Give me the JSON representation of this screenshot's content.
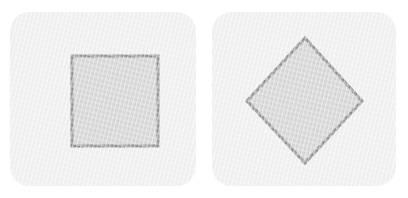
{
  "figure": {
    "background_color": "#ffffff",
    "width": 408,
    "height": 198,
    "panel_count": 2
  },
  "style": {
    "panel_fill": "#f2f2f2",
    "panel_corner_radius": 20,
    "shape_fill": "#d0d0d0",
    "shape_stroke": "#808080",
    "shape_stroke_width": 3
  },
  "panels": [
    {
      "id": "left",
      "name": "square-panel",
      "caption": "",
      "shape": {
        "name": "square",
        "type": "polygon",
        "rotation_degrees": 0,
        "fill": "#d0d0d0",
        "stroke": "#808080",
        "stroke_width": 3,
        "bounds": {
          "x": 62,
          "y": 44,
          "width": 86,
          "height": 90
        },
        "points": "62,44 148,44 148,134 62,134"
      }
    },
    {
      "id": "right",
      "name": "diamond-panel",
      "caption": "",
      "shape": {
        "name": "diamond",
        "type": "polygon",
        "rotation_degrees": 45,
        "fill": "#d0d0d0",
        "stroke": "#808080",
        "stroke_width": 3,
        "bounds": {
          "x": 35,
          "y": 26,
          "width": 115,
          "height": 125
        },
        "points": "93,26 150,89 93,151 35,89"
      }
    }
  ]
}
